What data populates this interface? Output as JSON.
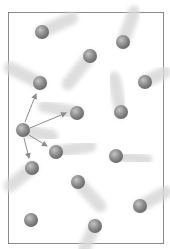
{
  "diagram": {
    "title": "",
    "frame": {
      "x": 8,
      "y": 12,
      "width": 155,
      "height": 231,
      "stroke": "#8a8a8a"
    },
    "colors": {
      "ball": "#8f8f8f",
      "ball_highlight": "#c4c4c4",
      "ball_shadow": "#6a6a6a",
      "trail": "#d8d8d8",
      "arrow": "#8d8d8d"
    },
    "ball_radius": 7,
    "molecules": [
      {
        "id": 1,
        "x": 42,
        "y": 32,
        "trail_to": [
          72,
          18
        ]
      },
      {
        "id": 2,
        "x": 123,
        "y": 42,
        "trail_to": [
          134,
          12
        ]
      },
      {
        "id": 3,
        "x": 90,
        "y": 56,
        "trail_to": [
          68,
          84
        ]
      },
      {
        "id": 4,
        "x": 40,
        "y": 83,
        "trail_to": [
          10,
          68
        ]
      },
      {
        "id": 5,
        "x": 145,
        "y": 82,
        "trail_to": [
          165,
          72
        ]
      },
      {
        "id": 6,
        "x": 77,
        "y": 113,
        "trail_to": [
          44,
          106
        ]
      },
      {
        "id": 7,
        "x": 121,
        "y": 112,
        "trail_to": [
          114,
          78
        ]
      },
      {
        "id": 8,
        "x": 23,
        "y": 130,
        "trail_to": [
          52,
          136
        ],
        "center": true
      },
      {
        "id": 9,
        "x": 56,
        "y": 152,
        "trail_to": [
          90,
          146
        ]
      },
      {
        "id": 10,
        "x": 116,
        "y": 156,
        "trail_to": [
          146,
          160
        ]
      },
      {
        "id": 11,
        "x": 32,
        "y": 168,
        "trail_to": [
          10,
          186
        ]
      },
      {
        "id": 12,
        "x": 78,
        "y": 182,
        "trail_to": [
          100,
          206
        ]
      },
      {
        "id": 13,
        "x": 140,
        "y": 206,
        "trail_to": [
          166,
          192
        ]
      },
      {
        "id": 14,
        "x": 31,
        "y": 220,
        "trail_to": [
          31,
          246
        ]
      },
      {
        "id": 15,
        "x": 95,
        "y": 226,
        "trail_to": [
          84,
          249
        ]
      }
    ],
    "arrows": [
      {
        "from": [
          25,
          122
        ],
        "to": [
          36,
          94
        ]
      },
      {
        "from": [
          30,
          128
        ],
        "to": [
          66,
          113
        ]
      },
      {
        "from": [
          29,
          135
        ],
        "to": [
          47,
          146
        ]
      },
      {
        "from": [
          24,
          138
        ],
        "to": [
          29,
          158
        ]
      }
    ]
  }
}
